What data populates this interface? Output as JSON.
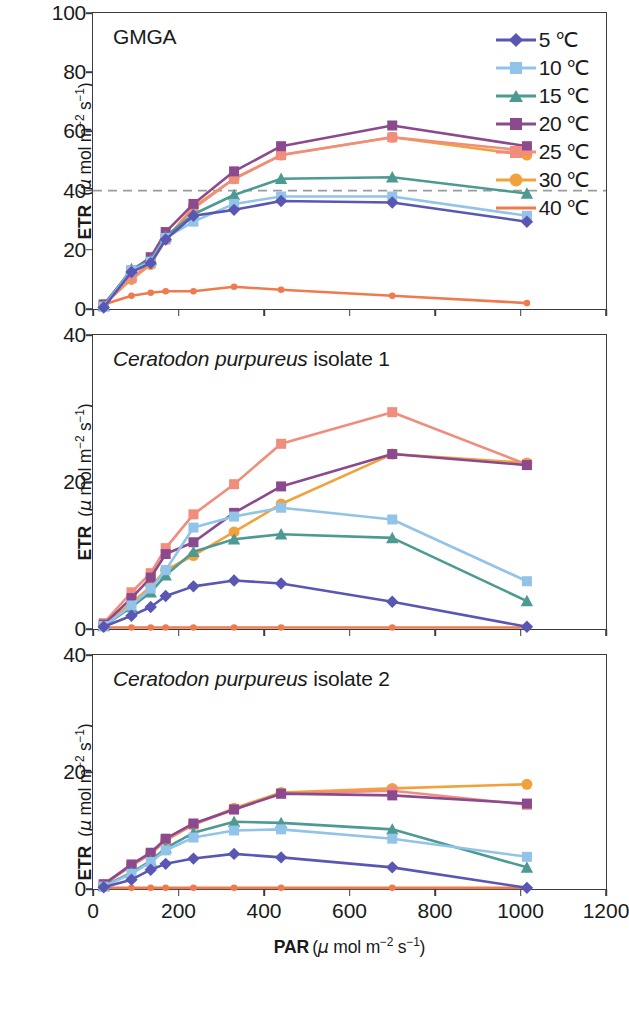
{
  "figure": {
    "panels": [
      {
        "title_italic": "",
        "title_plain": "GMGA"
      },
      {
        "title_italic": "Ceratodon purpureus",
        "title_plain": " isolate 1"
      },
      {
        "title_italic": "Ceratodon purpureus",
        "title_plain": " isolate 2"
      }
    ],
    "axis": {
      "xlabel_bold": "PAR",
      "xlabel_units": "(μ mol m⁻² s⁻¹)",
      "ylabel_bold": "ETR",
      "ylabel_units": "(μ mol m⁻² s⁻¹)"
    },
    "legend": {
      "entries": [
        {
          "label": "5 ℃",
          "color": "#5a57b4",
          "marker": "diamond"
        },
        {
          "label": "10 ℃",
          "color": "#92c3e8",
          "marker": "square"
        },
        {
          "label": "15 ℃",
          "color": "#4d9a93",
          "marker": "triangle"
        },
        {
          "label": "20 ℃",
          "color": "#8c4a8e",
          "marker": "square"
        },
        {
          "label": "25 ℃",
          "color": "#f08d7c",
          "marker": "square"
        },
        {
          "label": "30 ℃",
          "color": "#f2a23c",
          "marker": "circle"
        },
        {
          "label": "40 ℃",
          "color": "#ee7b4e",
          "marker": "none"
        }
      ]
    }
  },
  "chart_data": [
    {
      "type": "line",
      "title": "GMGA",
      "xlabel": "PAR (μ mol m⁻² s⁻¹)",
      "ylabel": "ETR (μ mol m⁻² s⁻¹)",
      "xlim": [
        0,
        1200
      ],
      "ylim": [
        0,
        100
      ],
      "xticks": [
        0,
        200,
        400,
        600,
        800,
        1000,
        1200
      ],
      "yticks": [
        0,
        20,
        40,
        60,
        80,
        100
      ],
      "grid": false,
      "reference_line_y": 40,
      "reference_line_style": "dashed",
      "legend_position": "top-right",
      "x": [
        25,
        90,
        135,
        170,
        235,
        330,
        440,
        700,
        1015
      ],
      "series": [
        {
          "name": "5 ℃",
          "color": "#5a57b4",
          "marker": "diamond",
          "values": [
            0.5,
            12.5,
            15.5,
            23.5,
            31.5,
            33.5,
            36.5,
            36.0,
            29.5
          ]
        },
        {
          "name": "10 ℃",
          "color": "#92c3e8",
          "marker": "square",
          "values": [
            0.8,
            13.0,
            16.0,
            24.0,
            29.5,
            35.5,
            38.0,
            38.0,
            31.5
          ]
        },
        {
          "name": "15 ℃",
          "color": "#4d9a93",
          "marker": "triangle",
          "values": [
            1.0,
            13.5,
            16.5,
            24.5,
            32.0,
            38.5,
            44.0,
            44.5,
            39.0
          ]
        },
        {
          "name": "20 ℃",
          "color": "#8c4a8e",
          "marker": "square",
          "values": [
            1.5,
            13.0,
            17.5,
            26.0,
            35.5,
            46.5,
            55.0,
            62.0,
            55.0
          ]
        },
        {
          "name": "25 ℃",
          "color": "#f08d7c",
          "marker": "square",
          "values": [
            1.5,
            10.5,
            15.5,
            23.5,
            34.0,
            44.0,
            52.0,
            58.0,
            53.5
          ]
        },
        {
          "name": "30 ℃",
          "color": "#f2a23c",
          "marker": "circle",
          "values": [
            1.5,
            10.0,
            15.0,
            23.5,
            34.5,
            44.0,
            52.0,
            58.0,
            52.0
          ]
        },
        {
          "name": "40 ℃",
          "color": "#ee7b4e",
          "marker": "none",
          "values": [
            1.5,
            4.5,
            5.5,
            6.0,
            6.0,
            7.5,
            6.5,
            4.5,
            2.0
          ]
        }
      ]
    },
    {
      "type": "line",
      "title": "Ceratodon purpureus isolate 1",
      "xlabel": "PAR (μ mol m⁻² s⁻¹)",
      "ylabel": "ETR (μ mol m⁻² s⁻¹)",
      "xlim": [
        0,
        1200
      ],
      "ylim": [
        0,
        40
      ],
      "xticks": [
        0,
        200,
        400,
        600,
        800,
        1000,
        1200
      ],
      "yticks": [
        0,
        20,
        40
      ],
      "grid": false,
      "x": [
        25,
        90,
        135,
        170,
        235,
        330,
        440,
        700,
        1015
      ],
      "series": [
        {
          "name": "5 ℃",
          "color": "#5a57b4",
          "marker": "diamond",
          "values": [
            0.3,
            1.8,
            3.0,
            4.5,
            5.8,
            6.6,
            6.2,
            3.7,
            0.3
          ]
        },
        {
          "name": "10 ℃",
          "color": "#92c3e8",
          "marker": "square",
          "values": [
            0.4,
            3.2,
            5.5,
            8.0,
            13.8,
            15.3,
            16.5,
            14.9,
            6.5
          ]
        },
        {
          "name": "15 ℃",
          "color": "#4d9a93",
          "marker": "triangle",
          "values": [
            0.4,
            3.0,
            5.0,
            7.3,
            10.5,
            12.2,
            12.9,
            12.4,
            3.8
          ]
        },
        {
          "name": "20 ℃",
          "color": "#8c4a8e",
          "marker": "square",
          "values": [
            0.6,
            4.2,
            7.0,
            10.2,
            11.8,
            15.8,
            19.4,
            23.8,
            22.3
          ]
        },
        {
          "name": "25 ℃",
          "color": "#f08d7c",
          "marker": "square",
          "values": [
            0.8,
            5.0,
            7.6,
            11.0,
            15.6,
            19.7,
            25.2,
            29.5,
            22.4
          ]
        },
        {
          "name": "30 ℃",
          "color": "#f2a23c",
          "marker": "circle",
          "values": [
            0.6,
            3.5,
            5.8,
            8.0,
            10.0,
            13.2,
            17.0,
            23.8,
            22.6
          ]
        },
        {
          "name": "40 ℃",
          "color": "#ee7b4e",
          "marker": "none",
          "values": [
            0.2,
            0.2,
            0.2,
            0.2,
            0.2,
            0.2,
            0.2,
            0.2,
            0.2
          ]
        }
      ]
    },
    {
      "type": "line",
      "title": "Ceratodon purpureus isolate 2",
      "xlabel": "PAR (μ mol m⁻² s⁻¹)",
      "ylabel": "ETR (μ mol m⁻² s⁻¹)",
      "xlim": [
        0,
        1200
      ],
      "ylim": [
        0,
        40
      ],
      "xticks": [
        0,
        200,
        400,
        600,
        800,
        1000,
        1200
      ],
      "yticks": [
        0,
        20,
        40
      ],
      "grid": false,
      "x": [
        25,
        90,
        135,
        170,
        235,
        330,
        440,
        700,
        1015
      ],
      "series": [
        {
          "name": "5 ℃",
          "color": "#5a57b4",
          "marker": "diamond",
          "values": [
            0.3,
            1.6,
            3.3,
            4.3,
            5.2,
            6.0,
            5.4,
            3.7,
            0.2
          ]
        },
        {
          "name": "10 ℃",
          "color": "#92c3e8",
          "marker": "square",
          "values": [
            0.4,
            2.6,
            4.6,
            6.6,
            8.8,
            10.0,
            10.2,
            8.6,
            5.5
          ]
        },
        {
          "name": "15 ℃",
          "color": "#4d9a93",
          "marker": "triangle",
          "values": [
            0.5,
            2.8,
            4.8,
            7.0,
            9.6,
            11.5,
            11.3,
            10.2,
            3.7
          ]
        },
        {
          "name": "20 ℃",
          "color": "#8c4a8e",
          "marker": "square",
          "values": [
            0.8,
            4.2,
            6.2,
            8.6,
            11.2,
            13.6,
            16.3,
            16.0,
            14.6
          ]
        },
        {
          "name": "25 ℃",
          "color": "#f08d7c",
          "marker": "square",
          "values": [
            0.8,
            4.0,
            6.0,
            8.4,
            11.0,
            13.6,
            16.3,
            16.8,
            14.4
          ]
        },
        {
          "name": "30 ℃",
          "color": "#f2a23c",
          "marker": "circle",
          "values": [
            0.8,
            4.0,
            6.0,
            8.3,
            11.0,
            13.8,
            16.5,
            17.2,
            17.9
          ]
        },
        {
          "name": "40 ℃",
          "color": "#ee7b4e",
          "marker": "none",
          "values": [
            0.2,
            0.2,
            0.2,
            0.2,
            0.2,
            0.2,
            0.2,
            0.2,
            0.2
          ]
        }
      ]
    }
  ]
}
